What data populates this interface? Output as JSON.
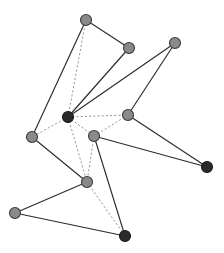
{
  "figure": {
    "width": 224,
    "height": 253,
    "background_color": "#ffffff"
  },
  "chart_data": {
    "type": "scatter",
    "title": "",
    "xlabel": "",
    "ylabel": "",
    "xlim": [
      0,
      224
    ],
    "ylim": [
      0,
      253
    ],
    "grid": false,
    "legend": "none",
    "node_styles": {
      "light": {
        "fill": "#8a8a8a",
        "stroke": "#3a3a3a",
        "radius": 5.5
      },
      "dark": {
        "fill": "#2a2a2a",
        "stroke": "#1a1a1a",
        "radius": 5.5
      }
    },
    "edge_styles": {
      "solid": {
        "stroke": "#2b2b2b",
        "width": 1.15,
        "dash": "none"
      },
      "dashed": {
        "stroke": "#8c8c8c",
        "width": 0.9,
        "dash": "2.2 2.0"
      }
    },
    "nodes": [
      {
        "id": "n0",
        "label": "top-left",
        "x": 86,
        "y": 20,
        "style": "light",
        "degree": 3
      },
      {
        "id": "n1",
        "label": "upper-middle",
        "x": 129,
        "y": 48,
        "style": "light",
        "degree": 2
      },
      {
        "id": "n2",
        "label": "top-right",
        "x": 175,
        "y": 43,
        "style": "light",
        "degree": 2
      },
      {
        "id": "n3",
        "label": "hub-center",
        "x": 68,
        "y": 117,
        "style": "dark",
        "degree": 7
      },
      {
        "id": "n4",
        "label": "right-middle",
        "x": 128,
        "y": 115,
        "style": "light",
        "degree": 4
      },
      {
        "id": "n5",
        "label": "center-lower",
        "x": 94,
        "y": 136,
        "style": "light",
        "degree": 5
      },
      {
        "id": "n6",
        "label": "left",
        "x": 32,
        "y": 137,
        "style": "light",
        "degree": 3
      },
      {
        "id": "n7",
        "label": "far-right",
        "x": 207,
        "y": 167,
        "style": "dark",
        "degree": 2
      },
      {
        "id": "n8",
        "label": "lower-left-middle",
        "x": 87,
        "y": 182,
        "style": "light",
        "degree": 5
      },
      {
        "id": "n9",
        "label": "bottom-left",
        "x": 15,
        "y": 213,
        "style": "light",
        "degree": 2
      },
      {
        "id": "n10",
        "label": "bottom-right",
        "x": 125,
        "y": 236,
        "style": "dark",
        "degree": 3
      }
    ],
    "edges": [
      {
        "source": "n0",
        "target": "n1",
        "style": "solid"
      },
      {
        "source": "n0",
        "target": "n6",
        "style": "solid"
      },
      {
        "source": "n0",
        "target": "n3",
        "style": "dashed"
      },
      {
        "source": "n1",
        "target": "n3",
        "style": "solid"
      },
      {
        "source": "n2",
        "target": "n3",
        "style": "solid"
      },
      {
        "source": "n2",
        "target": "n4",
        "style": "solid"
      },
      {
        "source": "n3",
        "target": "n4",
        "style": "dashed"
      },
      {
        "source": "n3",
        "target": "n5",
        "style": "dashed"
      },
      {
        "source": "n3",
        "target": "n6",
        "style": "dashed"
      },
      {
        "source": "n3",
        "target": "n8",
        "style": "dashed"
      },
      {
        "source": "n4",
        "target": "n5",
        "style": "dashed"
      },
      {
        "source": "n4",
        "target": "n7",
        "style": "solid"
      },
      {
        "source": "n5",
        "target": "n7",
        "style": "solid"
      },
      {
        "source": "n5",
        "target": "n8",
        "style": "dashed"
      },
      {
        "source": "n5",
        "target": "n10",
        "style": "solid"
      },
      {
        "source": "n6",
        "target": "n8",
        "style": "solid"
      },
      {
        "source": "n8",
        "target": "n9",
        "style": "solid"
      },
      {
        "source": "n8",
        "target": "n10",
        "style": "dashed"
      },
      {
        "source": "n9",
        "target": "n10",
        "style": "solid"
      }
    ]
  }
}
